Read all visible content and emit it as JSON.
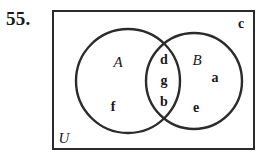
{
  "figure": {
    "problem_number": "55.",
    "universe_label": "U",
    "sets": [
      {
        "name": "A",
        "label": "A"
      },
      {
        "name": "B",
        "label": "B"
      }
    ],
    "regions": {
      "a_only": [
        "f"
      ],
      "intersection": [
        "d",
        "g",
        "b"
      ],
      "b_only": [
        "a",
        "e"
      ],
      "outside": [
        "c"
      ]
    },
    "elements": [
      {
        "id": "A",
        "label": "A",
        "region": "set-a-name",
        "x": 118,
        "y": 62,
        "style": "set-name"
      },
      {
        "id": "B",
        "label": "B",
        "region": "set-b-name",
        "x": 197,
        "y": 60,
        "style": "set-name"
      },
      {
        "id": "d",
        "label": "d",
        "region": "intersection",
        "x": 164,
        "y": 60,
        "style": "element"
      },
      {
        "id": "g",
        "label": "g",
        "region": "intersection",
        "x": 164,
        "y": 81,
        "style": "element"
      },
      {
        "id": "b",
        "label": "b",
        "region": "intersection",
        "x": 164,
        "y": 102,
        "style": "element"
      },
      {
        "id": "f",
        "label": "f",
        "region": "set-a-only",
        "x": 113,
        "y": 107,
        "style": "element"
      },
      {
        "id": "a",
        "label": "a",
        "region": "set-b-only",
        "x": 215,
        "y": 78,
        "style": "element"
      },
      {
        "id": "e",
        "label": "e",
        "region": "set-b-only",
        "x": 196,
        "y": 108,
        "style": "element"
      },
      {
        "id": "c",
        "label": "c",
        "region": "outside-sets",
        "x": 241,
        "y": 24,
        "style": "element"
      },
      {
        "id": "U",
        "label": "U",
        "region": "universe-corner",
        "x": 64,
        "y": 138,
        "style": "universe-name"
      }
    ],
    "geometry": {
      "rect": {
        "x": 52,
        "y": 10,
        "width": 203,
        "height": 140
      },
      "circle_a": {
        "cx": 128,
        "cy": 81,
        "r": 52
      },
      "circle_b": {
        "cx": 194,
        "cy": 81,
        "r": 48
      }
    },
    "colors": {
      "stroke": "#2b2b2b",
      "text": "#1a1a1a",
      "background": "#ffffff"
    }
  }
}
